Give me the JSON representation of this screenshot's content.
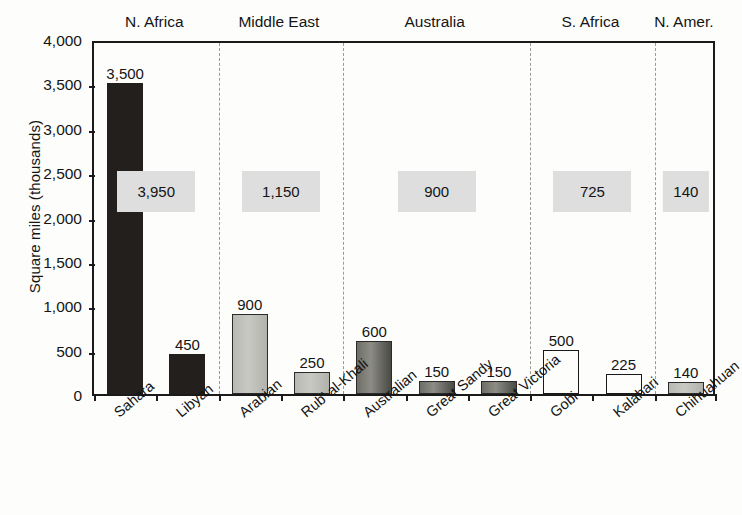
{
  "chart_data": {
    "type": "bar",
    "title": "",
    "xlabel": "",
    "ylabel": "Square miles (thousands)",
    "ylim": [
      0,
      4000
    ],
    "ytick_values": [
      4000,
      3500,
      3000,
      2500,
      2000,
      1500,
      1000,
      500,
      0
    ],
    "ytick_labels": [
      "4,000",
      "3,500",
      "3,000",
      "2,500",
      "2,000",
      "1,500",
      "1,000",
      "500",
      "0"
    ],
    "grid": false,
    "legend": "none",
    "categories": [
      "Sahara",
      "Libyan",
      "Arabian",
      "Rub' al-Khali",
      "Australian",
      "Great Sandy",
      "Great Victoria",
      "Gobi",
      "Kalahari",
      "Chihuahuan"
    ],
    "values": [
      3500,
      450,
      900,
      250,
      600,
      150,
      150,
      500,
      225,
      140
    ],
    "value_labels": [
      "3,500",
      "450",
      "900",
      "250",
      "600",
      "150",
      "150",
      "500",
      "225",
      "140"
    ],
    "bar_styles": [
      "dark",
      "dark",
      "light",
      "light",
      "mid",
      "mid",
      "mid",
      "open",
      "open",
      "light"
    ],
    "groups": [
      {
        "name": "N. Africa",
        "header": "N. Africa",
        "total": 3950,
        "total_label": "3,950",
        "members": [
          "Sahara",
          "Libyan"
        ]
      },
      {
        "name": "Middle East",
        "header": "Middle East",
        "total": 1150,
        "total_label": "1,150",
        "members": [
          "Arabian",
          "Rub' al-Khali"
        ]
      },
      {
        "name": "Australia",
        "header": "Australia",
        "total": 900,
        "total_label": "900",
        "members": [
          "Australian",
          "Great Sandy",
          "Great Victoria"
        ]
      },
      {
        "name": "S. Africa",
        "header": "S. Africa",
        "total": 725,
        "total_label": "725",
        "members": [
          "Gobi",
          "Kalahari"
        ]
      },
      {
        "name": "N. Amer.",
        "header": "N. Amer.",
        "total": 140,
        "total_label": "140",
        "members": [
          "Chihuahuan"
        ]
      }
    ]
  },
  "axis": {
    "y_title": "Square miles (thousands)",
    "y_ticks": [
      "4,000",
      "3,500",
      "3,000",
      "2,500",
      "2,000",
      "1,500",
      "1,000",
      "500",
      "0"
    ]
  },
  "headers": [
    "N. Africa",
    "Middle East",
    "Australia",
    "S. Africa",
    "N. Amer."
  ],
  "totals": [
    "3,950",
    "1,150",
    "900",
    "725",
    "140"
  ],
  "bars": [
    {
      "label": "Sahara",
      "value_label": "3,500"
    },
    {
      "label": "Libyan",
      "value_label": "450"
    },
    {
      "label": "Arabian",
      "value_label": "900"
    },
    {
      "label": "Rub' al-Khali",
      "value_label": "250"
    },
    {
      "label": "Australian",
      "value_label": "600"
    },
    {
      "label": "Great Sandy",
      "value_label": "150"
    },
    {
      "label": "Great Victoria",
      "value_label": "150"
    },
    {
      "label": "Gobi",
      "value_label": "500"
    },
    {
      "label": "Kalahari",
      "value_label": "225"
    },
    {
      "label": "Chihuahuan",
      "value_label": "140"
    }
  ]
}
